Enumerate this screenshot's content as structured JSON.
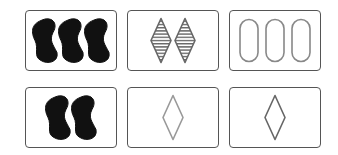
{
  "game": "Set",
  "colors": {
    "solid": "#111111",
    "outline_purple": "#777777",
    "card_border": "#555555"
  },
  "cards": [
    {
      "row": 0,
      "col": 0,
      "count": 3,
      "shape": "squiggle",
      "shading": "solid",
      "color": "#111111"
    },
    {
      "row": 0,
      "col": 1,
      "count": 2,
      "shape": "diamond",
      "shading": "striped",
      "color": "#666666"
    },
    {
      "row": 0,
      "col": 2,
      "count": 3,
      "shape": "oval",
      "shading": "open",
      "color": "#888888"
    },
    {
      "row": 1,
      "col": 0,
      "count": 2,
      "shape": "squiggle",
      "shading": "solid",
      "color": "#111111"
    },
    {
      "row": 1,
      "col": 1,
      "count": 1,
      "shape": "diamond",
      "shading": "open",
      "color": "#999999"
    },
    {
      "row": 1,
      "col": 2,
      "count": 1,
      "shape": "diamond",
      "shading": "open",
      "color": "#666666"
    }
  ]
}
